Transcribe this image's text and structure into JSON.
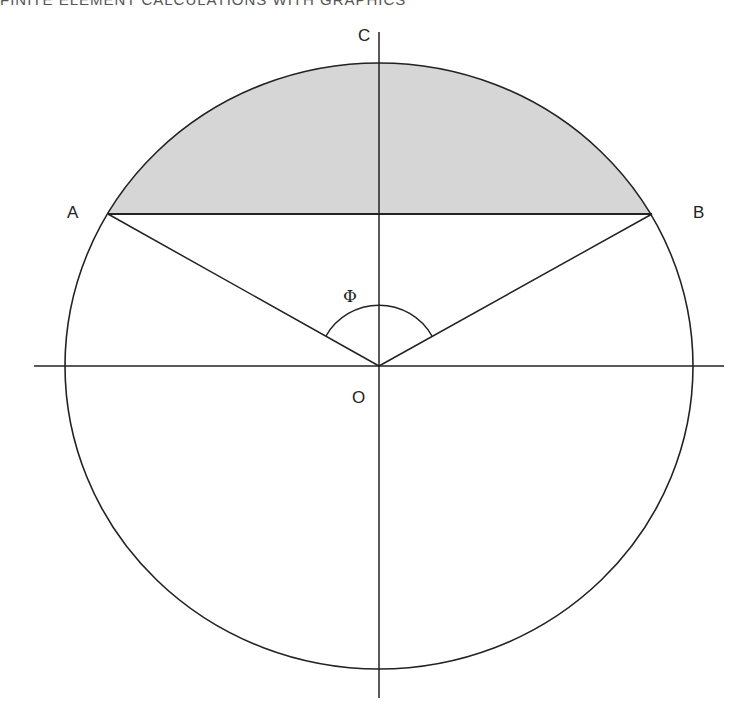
{
  "header": {
    "text": "FINITE ELEMENT CALCULATIONS WITH GRAPHICS"
  },
  "diagram": {
    "colors": {
      "stroke": "#222222",
      "segment_fill": "#d6d6d6",
      "background": "#ffffff"
    },
    "labels": {
      "A": "A",
      "B": "B",
      "C": "C",
      "O": "O",
      "angle": "Φ"
    },
    "points": {
      "O": [
        379,
        366
      ],
      "A": [
        108,
        214
      ],
      "B": [
        652,
        214
      ],
      "C": [
        379,
        63
      ]
    },
    "circle": {
      "cx": 379,
      "cy": 366,
      "rx": 314,
      "ry": 303
    },
    "axes": {
      "horizontal": [
        34,
        724
      ],
      "vertical": [
        32,
        698
      ]
    }
  }
}
